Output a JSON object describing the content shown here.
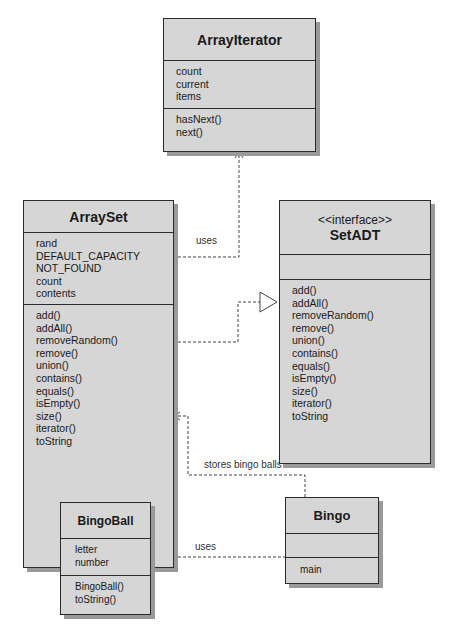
{
  "classes": {
    "array_iterator": {
      "name": "ArrayIterator",
      "attributes": [
        "count",
        "current",
        "items"
      ],
      "methods": [
        "hasNext()",
        "next()"
      ]
    },
    "array_set": {
      "name": "ArraySet",
      "attributes": [
        "rand",
        "DEFAULT_CAPACITY",
        "NOT_FOUND",
        "count",
        "contents"
      ],
      "methods": [
        "add()",
        "addAll()",
        "removeRandom()",
        "remove()",
        "union()",
        "contains()",
        "equals()",
        "isEmpty()",
        "size()",
        "iterator()",
        "toString"
      ]
    },
    "set_adt": {
      "stereotype": "<<interface>>",
      "name": "SetADT",
      "attributes": [],
      "methods": [
        "add()",
        "addAll()",
        "removeRandom()",
        "remove()",
        "union()",
        "contains()",
        "equals()",
        "isEmpty()",
        "size()",
        "iterator()",
        "toString"
      ]
    },
    "bingo_ball": {
      "name": "BingoBall",
      "attributes": [
        "letter",
        "number"
      ],
      "methods": [
        "BingoBall()",
        "toString()"
      ]
    },
    "bingo": {
      "name": "Bingo",
      "attributes": [],
      "methods": [
        "main"
      ]
    }
  },
  "relationships": [
    {
      "from": "ArraySet",
      "to": "ArrayIterator",
      "type": "dependency",
      "label": "uses"
    },
    {
      "from": "ArraySet",
      "to": "SetADT",
      "type": "realization",
      "label": ""
    },
    {
      "from": "Bingo",
      "to": "ArraySet",
      "type": "dependency",
      "label": "stores bingo balls in"
    },
    {
      "from": "Bingo",
      "to": "BingoBall",
      "type": "dependency",
      "label": "uses"
    }
  ],
  "colors": {
    "class_fill": "#d6d6d6",
    "border": "#2a2a2a",
    "shadow": "#9a9a9a",
    "line": "#444444"
  }
}
